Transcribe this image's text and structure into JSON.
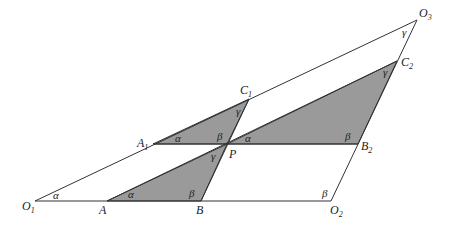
{
  "diagram": {
    "colors": {
      "stroke": "#333333",
      "fill": "#9a9a9a",
      "background": "#ffffff"
    },
    "points": {
      "O1": {
        "label": "O",
        "sub": "1",
        "x": 35,
        "y": 201
      },
      "A": {
        "label": "A",
        "sub": "",
        "x": 107,
        "y": 201
      },
      "B": {
        "label": "B",
        "sub": "",
        "x": 201,
        "y": 201
      },
      "O2": {
        "label": "O",
        "sub": "2",
        "x": 331,
        "y": 201
      },
      "A1": {
        "label": "A",
        "sub": "1",
        "x": 153,
        "y": 144
      },
      "P": {
        "label": "P",
        "sub": "",
        "x": 227,
        "y": 144
      },
      "B2": {
        "label": "B",
        "sub": "2",
        "x": 358,
        "y": 144
      },
      "C1": {
        "label": "C",
        "sub": "1",
        "x": 249,
        "y": 99
      },
      "C2": {
        "label": "C",
        "sub": "2",
        "x": 397,
        "y": 61
      },
      "O3": {
        "label": "O",
        "sub": "3",
        "x": 417,
        "y": 20
      }
    },
    "angles": {
      "alpha": "α",
      "beta": "β",
      "gamma": "γ"
    }
  }
}
